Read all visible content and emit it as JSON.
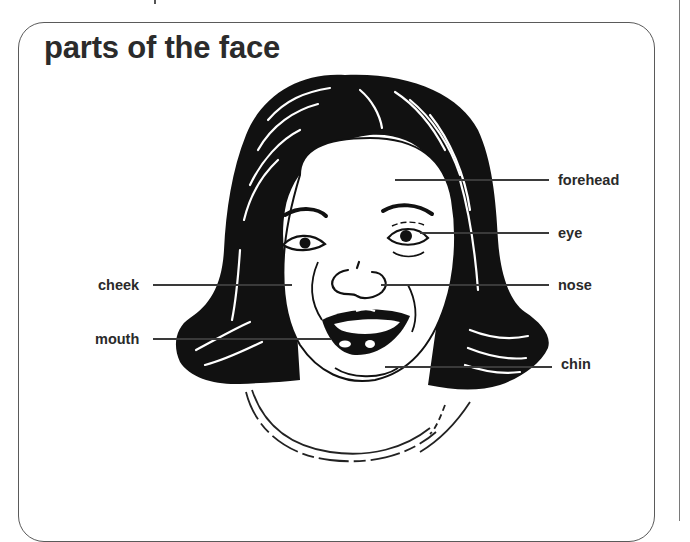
{
  "title": "parts of the face",
  "labels": {
    "forehead": "forehead",
    "eye": "eye",
    "cheek": "cheek",
    "nose": "nose",
    "mouth": "mouth",
    "chin": "chin"
  },
  "colors": {
    "ink": "#111111",
    "label_text": "#2a2a2a",
    "frame": "#5a5a5a",
    "background": "#ffffff"
  }
}
